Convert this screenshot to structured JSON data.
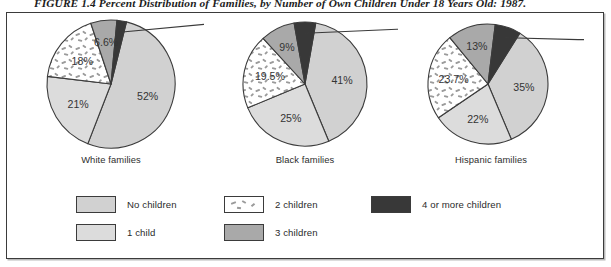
{
  "figure": {
    "title": "FIGURE 1.4 Percent Distribution of Families, by Number of Own Children Under 18 Years Old: 1987."
  },
  "colors": {
    "no_children": "#d1d1d1",
    "one_child": "#dcdcdc",
    "two_children": "#ffffff",
    "three_children": "#a9a9a9",
    "four_or_more": "#383838",
    "outline": "#3b3b3b",
    "text": "#2b2b2b",
    "frame": "#3b3b3b"
  },
  "legend": {
    "items": [
      {
        "label": "No children",
        "key": "no_children",
        "swatch": "light-gray"
      },
      {
        "label": "1 child",
        "key": "one_child",
        "swatch": "lighter-gray"
      },
      {
        "label": "2 children",
        "key": "two_children",
        "swatch": "white-dashed"
      },
      {
        "label": "3 children",
        "key": "three_children",
        "swatch": "medium-gray"
      },
      {
        "label": "4 or more children",
        "key": "four_or_more",
        "swatch": "dark-gray"
      }
    ]
  },
  "chart_data": {
    "type": "pie",
    "title": "FIGURE 1.4 Percent Distribution of Families, by Number of Own Children Under 18 Years Old: 1987.",
    "xlabel": "",
    "ylabel": "",
    "legend_position": "bottom",
    "grid": false,
    "categories": [
      "No children",
      "1 child",
      "2 children",
      "3 children",
      "4 or more children"
    ],
    "charts": [
      {
        "name": "White families",
        "caption": "White families",
        "values": [
          52,
          21,
          18,
          6.6,
          2.4
        ],
        "labels": [
          "52%",
          "21%",
          "18%",
          "6.6%",
          "2.4%"
        ],
        "callout_slices": [
          "4 or more children"
        ]
      },
      {
        "name": "Black families",
        "caption": "Black families",
        "values": [
          41,
          25,
          19.5,
          9,
          5.6
        ],
        "labels": [
          "41%",
          "25%",
          "19.5%",
          "9%",
          "5.6%"
        ],
        "callout_slices": [
          "4 or more children"
        ]
      },
      {
        "name": "Hispanic families",
        "caption": "Hispanic families",
        "values": [
          35,
          22,
          23.7,
          13,
          7
        ],
        "labels": [
          "35%",
          "22%",
          "23.7%",
          "13%",
          "7%"
        ],
        "callout_slices": [
          "4 or more children"
        ]
      }
    ]
  }
}
